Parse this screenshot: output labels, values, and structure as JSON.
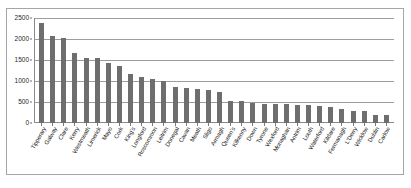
{
  "figure": {
    "top_crop_text": "",
    "caption_text": ""
  },
  "chart_data": {
    "type": "bar",
    "title": "",
    "xlabel": "",
    "ylabel": "",
    "ylim": [
      0,
      2500
    ],
    "ytick_values": [
      2500,
      2000,
      1500,
      1000,
      500,
      0
    ],
    "ytick_labels": [
      "2500",
      "2000",
      "1500",
      "1000",
      "500",
      "0"
    ],
    "grid": true,
    "legend": false,
    "bar_color": "#6e6e6e",
    "categories": [
      "Tipperary",
      "Galway",
      "Clare",
      "Kerry",
      "Westmeath",
      "Limerick",
      "Mayo",
      "Cork",
      "King's",
      "Longford",
      "Roscommon",
      "Leitrim",
      "Donegal",
      "Cavan",
      "Meath",
      "Sligo",
      "Armagh",
      "Queen's",
      "Kilkenny",
      "Down",
      "Tyrone",
      "Wexford",
      "Monaghan",
      "Antrim",
      "Louth",
      "Waterford",
      "Kildare",
      "Fermanagh",
      "L'Derry",
      "Wicklow",
      "Dublin",
      "Carlow"
    ],
    "values": [
      2370,
      2070,
      2020,
      1670,
      1555,
      1545,
      1420,
      1350,
      1175,
      1100,
      1045,
      1010,
      865,
      835,
      815,
      780,
      750,
      520,
      520,
      485,
      460,
      455,
      455,
      430,
      425,
      405,
      390,
      325,
      295,
      285,
      200,
      195
    ]
  }
}
